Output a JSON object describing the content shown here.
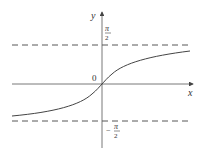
{
  "diagram": {
    "title": "",
    "function": "y = arctan x",
    "axes": {
      "x_label": "x",
      "y_label": "y",
      "origin_label": "0"
    },
    "asymptotes": [
      {
        "name": "upper",
        "value": "π/2",
        "numerator": "π",
        "denominator": "2",
        "sign": ""
      },
      {
        "name": "lower",
        "value": "-π/2",
        "numerator": "π",
        "denominator": "2",
        "sign": "−"
      }
    ],
    "colors": {
      "axis": "#555555",
      "curve": "#444444",
      "asymptote": "#444444",
      "background": "#ffffff"
    }
  }
}
